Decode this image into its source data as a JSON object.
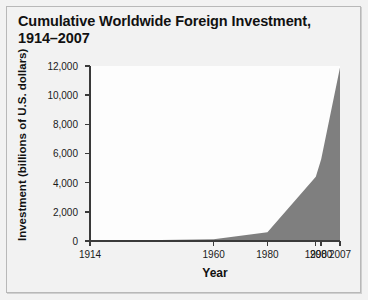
{
  "chart_data": {
    "type": "area",
    "title": "Cumulative Worldwide Foreign Investment,\n1914–2007",
    "xlabel": "Year",
    "ylabel": "Investment (billions of U.S. dollars)",
    "xlim": [
      1914,
      2007
    ],
    "ylim": [
      0,
      12000
    ],
    "grid": false,
    "legend": false,
    "x_tick_labels": [
      "1914",
      "1960",
      "1980",
      "1998",
      "2000",
      "2007"
    ],
    "x_tick_values": [
      1914,
      1960,
      1980,
      1998,
      2000,
      2007
    ],
    "y_tick_labels": [
      "0",
      "2,000",
      "4,000",
      "6,000",
      "8,000",
      "10,000",
      "12,000"
    ],
    "y_tick_values": [
      0,
      2000,
      4000,
      6000,
      8000,
      10000,
      12000
    ],
    "series": [
      {
        "name": "Cumulative worldwide foreign investment",
        "fill_color": "#7f7f7f",
        "x": [
          1914,
          1960,
          1980,
          1998,
          2000,
          2007
        ],
        "values": [
          0,
          120,
          600,
          4400,
          5600,
          11900
        ]
      }
    ]
  },
  "figure": {
    "background_color": "#f2f2f2",
    "plot_background_color": "#fdfdfd",
    "axis_color": "#3a3a3a",
    "border_color": "#b8b8b8"
  }
}
